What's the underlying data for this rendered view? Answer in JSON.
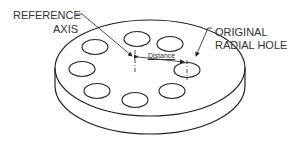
{
  "diagram": {
    "labels": {
      "reference_axis_line1": "REFERENCE",
      "reference_axis_line2": "AXIS",
      "original_hole_line1": "ORIGINAL",
      "original_hole_line2": "RADIAL HOLE",
      "distance": "Distance"
    },
    "hole_count": 8,
    "colors": {
      "stroke": "#222222",
      "background": "#ffffff"
    }
  }
}
